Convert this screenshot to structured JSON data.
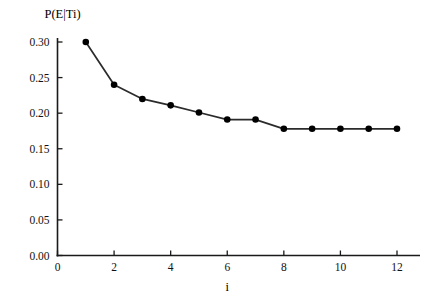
{
  "chart_data": {
    "type": "line",
    "title": "",
    "xlabel": "i",
    "ylabel": "P(E|Ti)",
    "x": [
      1,
      2,
      3,
      4,
      5,
      6,
      7,
      8,
      9,
      10,
      11,
      12
    ],
    "values": [
      0.3,
      0.24,
      0.22,
      0.211,
      0.201,
      0.191,
      0.191,
      0.178,
      0.178,
      0.178,
      0.178,
      0.178
    ],
    "series": [
      {
        "name": "P(E|Ti)",
        "values": [
          0.3,
          0.24,
          0.22,
          0.211,
          0.201,
          0.191,
          0.191,
          0.178,
          0.178,
          0.178,
          0.178,
          0.178
        ]
      }
    ],
    "xlim": [
      0,
      12.9
    ],
    "ylim": [
      0.0,
      0.315
    ],
    "xticks": [
      0,
      2,
      4,
      6,
      8,
      10,
      12
    ],
    "xtick_labels": [
      "0",
      "2",
      "4",
      "6",
      "8",
      "10",
      "12"
    ],
    "yticks": [
      0.0,
      0.05,
      0.1,
      0.15,
      0.2,
      0.25,
      0.3
    ],
    "ytick_labels": [
      "0.00",
      "0.05",
      "0.10",
      "0.15",
      "0.20",
      "0.25",
      "0.30"
    ],
    "grid": false,
    "legend": "none",
    "marker": "filled-circle",
    "line_color": "#2b2b2b",
    "marker_color": "#000000",
    "axis_color": "#1a1a1a",
    "background_color": "#ffffff"
  }
}
